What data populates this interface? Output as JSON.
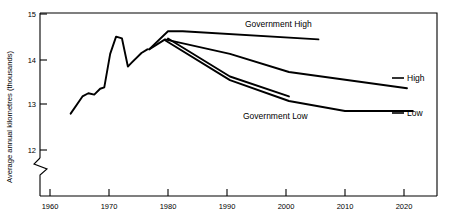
{
  "chart_data": {
    "type": "line",
    "title": "",
    "xlabel": "",
    "ylabel": "Average annual kilometres (thousands)",
    "xlim": [
      1957,
      2025
    ],
    "ylim": [
      11.6,
      15
    ],
    "axis_break": true,
    "axis_break_note": "y-axis broken below 12",
    "grid": false,
    "legend_position": "inline-annotations",
    "yticks": [
      "15",
      "14",
      "13",
      "12"
    ],
    "ytick_values": [
      15,
      14,
      13,
      12
    ],
    "xticks": [
      "1960",
      "1970",
      "1980",
      "1990",
      "2000",
      "2010",
      "2020"
    ],
    "xtick_values": [
      1960,
      1970,
      1980,
      1990,
      2000,
      2010,
      2020
    ],
    "series": [
      {
        "name": "Historical",
        "label": "",
        "x": [
          1963.5,
          1965.5,
          1966.5,
          1967.5,
          1968.5,
          1969.2,
          1970.2,
          1971.2,
          1972.2,
          1973.2,
          1973.8,
          1975.5,
          1976.5
        ],
        "values": [
          12.8,
          13.18,
          13.25,
          13.22,
          13.35,
          13.38,
          14.12,
          14.5,
          14.46,
          13.84,
          13.92,
          14.14,
          14.22
        ]
      },
      {
        "name": "Government High",
        "label": "Government High",
        "label_x": 2000.5,
        "label_y": 14.82,
        "x": [
          1976.8,
          1980.0,
          1982.5,
          2005.5
        ],
        "values": [
          14.22,
          14.62,
          14.62,
          14.44
        ]
      },
      {
        "name": "High",
        "label": "High",
        "label_x": 2023.5,
        "label_y": 13.7,
        "x": [
          1976.8,
          1979.5,
          1990.5,
          2000.5,
          2020.5
        ],
        "values": [
          14.22,
          14.44,
          14.12,
          13.72,
          13.36
        ]
      },
      {
        "name": "Government Low",
        "label": "Government Low",
        "label_x": 1991.0,
        "label_y": 12.86,
        "x": [
          1980.0,
          1990.5,
          2000.5
        ],
        "values": [
          14.46,
          13.62,
          13.18
        ]
      },
      {
        "name": "Low",
        "label": "Low",
        "label_x": 2023.5,
        "label_y": 12.94,
        "x": [
          1979.5,
          1990.5,
          2000.5,
          2010.0,
          2021.5
        ],
        "values": [
          14.42,
          13.54,
          13.08,
          12.86,
          12.86
        ]
      }
    ],
    "annotations": [
      {
        "name": "government-high-label",
        "text": "Government High"
      },
      {
        "name": "high-label",
        "text": "High"
      },
      {
        "name": "government-low-label",
        "text": "Government Low"
      },
      {
        "name": "low-label",
        "text": "Low"
      }
    ],
    "footer_artifact": ""
  }
}
